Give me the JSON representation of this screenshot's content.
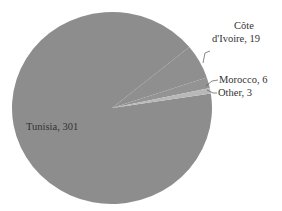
{
  "chart_data": {
    "type": "pie",
    "title": "",
    "slices": [
      {
        "label": "Tunisia",
        "value": 301,
        "color": "#8d8d8d"
      },
      {
        "label": "Côte d'Ivoire",
        "value": 19,
        "color": "#8f8f8f"
      },
      {
        "label": "Morocco",
        "value": 6,
        "color": "#939393"
      },
      {
        "label": "Other",
        "value": 3,
        "color": "#b8b8b8"
      }
    ],
    "labels_text": [
      "Tunisia, 301",
      "Côte d'Ivoire, 19",
      "Morocco, 6",
      "Other, 3"
    ],
    "legend": "none",
    "label_position": "data labels with leader lines"
  },
  "labels": {
    "tunisia": "Tunisia, 301",
    "cote_line1": "Côte",
    "cote_line2": "d'Ivoire, 19",
    "morocco": "Morocco, 6",
    "other": "Other, 3"
  }
}
